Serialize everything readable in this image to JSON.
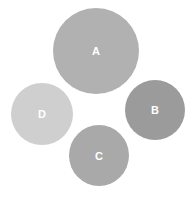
{
  "diagram": {
    "nodes": [
      {
        "id": "A",
        "label": "A",
        "cx": 96,
        "cy": 51,
        "r": 43,
        "color": "#b1b1b1"
      },
      {
        "id": "B",
        "label": "B",
        "cx": 155,
        "cy": 110,
        "r": 30,
        "color": "#9b9b9b"
      },
      {
        "id": "C",
        "label": "C",
        "cx": 99,
        "cy": 155,
        "r": 30,
        "color": "#a9a9a9"
      },
      {
        "id": "D",
        "label": "D",
        "cx": 42,
        "cy": 114,
        "r": 31,
        "color": "#cfcfcf"
      }
    ]
  }
}
